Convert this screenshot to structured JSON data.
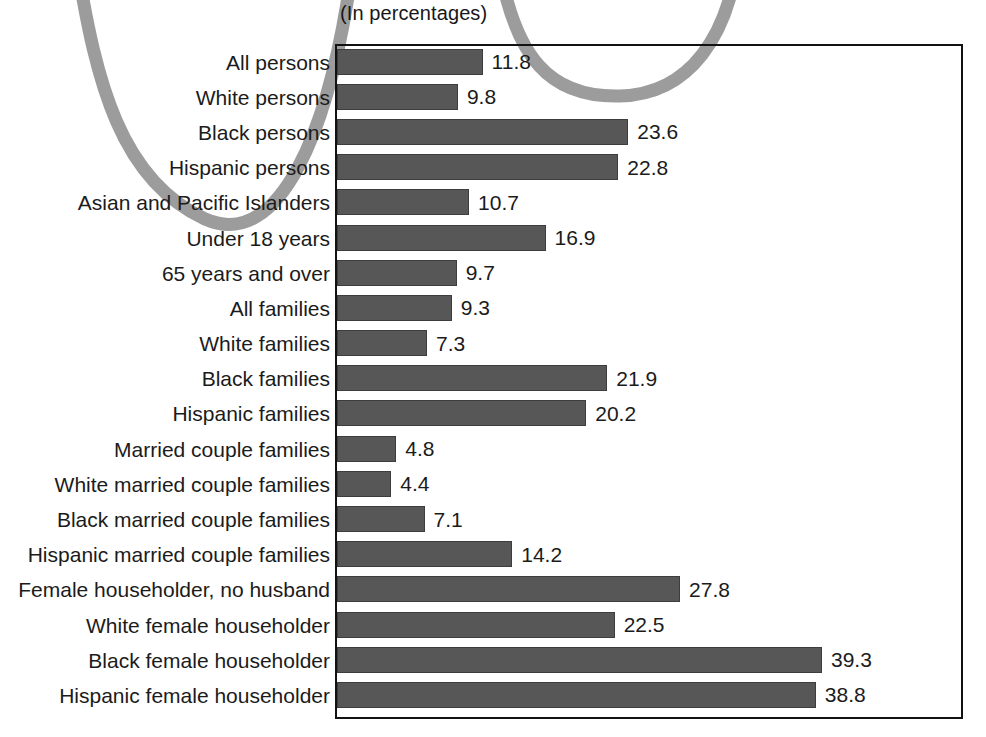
{
  "subtitle": "(In percentages)",
  "decor": {
    "curve_color": "#9c9c9c",
    "curve_name": "decorative-gray-curve"
  },
  "colors": {
    "bar_fill": "#575757",
    "frame": "#121212",
    "text": "#1b1b1b"
  },
  "chart_data": {
    "type": "bar",
    "orientation": "horizontal",
    "title": "",
    "subtitle": "(In percentages)",
    "xlabel": "",
    "ylabel": "",
    "xlim": [
      0,
      50
    ],
    "grid": false,
    "legend": false,
    "value_labels": true,
    "categories": [
      "All persons",
      "White persons",
      "Black persons",
      "Hispanic persons",
      "Asian and Pacific Islanders",
      "Under 18 years",
      "65 years and over",
      "All families",
      "White families",
      "Black families",
      "Hispanic families",
      "Married couple families",
      "White married couple families",
      "Black married couple families",
      "Hispanic married couple families",
      "Female householder, no husband",
      "White female householder",
      "Black female householder",
      "Hispanic female householder"
    ],
    "values": [
      11.8,
      9.8,
      23.6,
      22.8,
      10.7,
      16.9,
      9.7,
      9.3,
      7.3,
      21.9,
      20.2,
      4.8,
      4.4,
      7.1,
      14.2,
      27.8,
      22.5,
      39.3,
      38.8
    ],
    "value_text": [
      "11.8",
      "9.8",
      "23.6",
      "22.8",
      "10.7",
      "16.9",
      "9.7",
      "9.3",
      "7.3",
      "21.9",
      "20.2",
      "4.8",
      "4.4",
      "7.1",
      "14.2",
      "27.8",
      "22.5",
      "39.3",
      "38.8"
    ]
  }
}
